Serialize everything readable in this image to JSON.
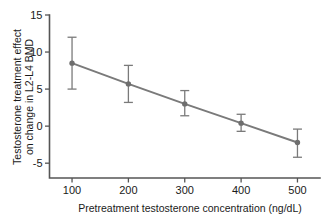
{
  "chart_data": {
    "type": "line",
    "title": "",
    "xlabel": "Pretreatment testosterone concentration (ng/dL)",
    "ylabel": "Testosterone treatment effect on change in L2-L4 BMD",
    "ylabel_line1": "Testosterone treatment effect",
    "ylabel_line2": "on change in L2-L4 BMD",
    "x": [
      100,
      200,
      300,
      400,
      500
    ],
    "xtick_labels": [
      "100",
      "200",
      "300",
      "400",
      "500"
    ],
    "ytick_labels": [
      "15",
      "10",
      "5",
      "0",
      "-5"
    ],
    "ytick_values": [
      15,
      10,
      5,
      0,
      -5
    ],
    "xlim": [
      60,
      540
    ],
    "ylim": [
      -7,
      15
    ],
    "grid": false,
    "legend": "none",
    "series": [
      {
        "name": "Testosterone treatment effect",
        "values": [
          8.5,
          5.7,
          3.0,
          0.4,
          -2.2
        ],
        "error_upper": [
          12.0,
          8.2,
          4.8,
          1.6,
          -0.4
        ],
        "error_lower": [
          5.0,
          3.2,
          1.4,
          -0.7,
          -4.2
        ],
        "color": "#7a7a7a",
        "marker": "circle"
      }
    ]
  },
  "colors": {
    "line": "#7a7a7a",
    "marker": "#6e6e6e",
    "error": "#8a8a8a",
    "axis": "#555555",
    "text": "#1a1a1a",
    "background": "#ffffff"
  }
}
